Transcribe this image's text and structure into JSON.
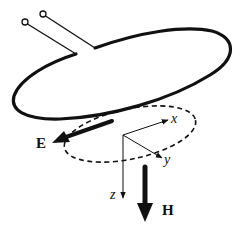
{
  "diagram": {
    "colors": {
      "background": "#ffffff",
      "stroke": "#111111"
    },
    "labels": {
      "electric_field": "E",
      "magnetic_field": "H",
      "axis_x": "x",
      "axis_y": "y",
      "axis_z": "z"
    },
    "components": [
      {
        "id": "feed-terminals",
        "description": "Two open-circle terminals with feed leads"
      },
      {
        "id": "loop-antenna",
        "description": "Solid elliptical wire loop"
      },
      {
        "id": "field-region",
        "description": "Dashed ellipse below loop"
      },
      {
        "id": "coordinate-axes",
        "description": "x, y, z axes from common origin"
      },
      {
        "id": "e-field-arrow",
        "description": "Thick arrow pointing left-down labeled E"
      },
      {
        "id": "h-field-arrow",
        "description": "Thick arrow pointing down labeled H"
      }
    ]
  }
}
